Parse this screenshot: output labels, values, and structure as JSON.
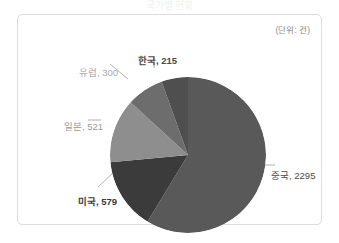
{
  "page": {
    "cut_off_title": "국가별 현황",
    "unit_label": "(단위: 건)"
  },
  "chart_data": {
    "type": "pie",
    "title": "",
    "subtitle": "",
    "unit": "건",
    "unit_label": "(단위: 건)",
    "xlabel": "",
    "ylabel": "",
    "legend_position": "none",
    "grid": false,
    "start_angle_deg": 0,
    "direction": "clockwise",
    "total": 3910,
    "categories": [
      "중국",
      "미국",
      "일본",
      "유럽",
      "한국"
    ],
    "values": [
      2295,
      579,
      521,
      300,
      215
    ],
    "colors": [
      "#595959",
      "#3b3b3b",
      "#8e8e8e",
      "#6d6d6d",
      "#4f4f4f"
    ],
    "slices": [
      {
        "name": "중국",
        "value": 2295,
        "label": "중국, 2295",
        "color": "#595959",
        "percent": 58.7
      },
      {
        "name": "미국",
        "value": 579,
        "label": "미국, 579",
        "color": "#3b3b3b",
        "percent": 14.8
      },
      {
        "name": "일본",
        "value": 521,
        "label": "일본, 521",
        "color": "#8e8e8e",
        "percent": 13.3
      },
      {
        "name": "유럽",
        "value": 300,
        "label": "유럽, 300",
        "color": "#6d6d6d",
        "percent": 7.7
      },
      {
        "name": "한국",
        "value": 215,
        "label": "한국, 215",
        "color": "#4f4f4f",
        "percent": 5.5
      }
    ]
  }
}
